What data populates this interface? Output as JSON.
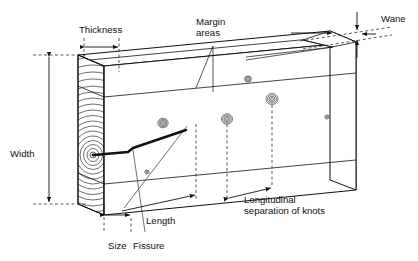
{
  "figure": {
    "type": "technical-diagram",
    "background_color": "#ffffff",
    "line_color": "#111111",
    "width_px": 418,
    "height_px": 261
  },
  "labels": {
    "thickness": "Thickness",
    "margin_areas_line1": "Margin",
    "margin_areas_line2": "areas",
    "wane": "Wane",
    "width": "Width",
    "size": "Size",
    "fissure": "Fissure",
    "length": "Length",
    "longitudinal_line1": "Longitudinal",
    "longitudinal_line2": "separation of knots"
  },
  "features": {
    "end_grain_rings": "growth-ring-annulus",
    "pith": "pith-center",
    "knot_count": 5,
    "fissure": "pith-shake-crack",
    "wane_gap": "top-right-corner-wane"
  }
}
